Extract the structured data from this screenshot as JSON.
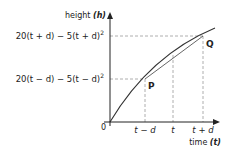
{
  "diagram": {
    "type": "graph",
    "y_axis": {
      "label": "height",
      "symbol": "(h)"
    },
    "x_axis": {
      "label": "time",
      "symbol": "(t)"
    },
    "origin_label": "0",
    "y_ticks": {
      "upper": "20(t + d) − 5(t + d)",
      "upper_exp": "2",
      "lower": "20(t − d) − 5(t − d)",
      "lower_exp": "2"
    },
    "x_ticks": [
      "t − d",
      "t",
      "t + d"
    ],
    "points": [
      {
        "name": "P",
        "x_label": "t − d"
      },
      {
        "name": "Q",
        "x_label": "t + d"
      }
    ],
    "colors": {
      "curve": "#333333",
      "axis": "#222222",
      "dashed": "#999999"
    }
  }
}
